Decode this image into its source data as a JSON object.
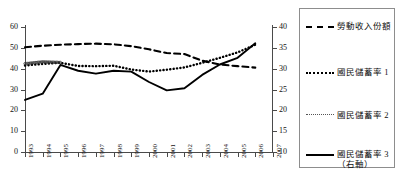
{
  "chart_data": {
    "type": "line",
    "title": "",
    "xlabel": "",
    "ylabel": "",
    "grid": false,
    "legend_position": "right",
    "x": [
      1993,
      1994,
      1995,
      1996,
      1997,
      1998,
      1999,
      2000,
      2001,
      2002,
      2003,
      2004,
      2005,
      2006
    ],
    "xtick_labels": [
      "1993",
      "1994",
      "1995",
      "1996",
      "1997",
      "1998",
      "1999",
      "2000",
      "2001",
      "2002",
      "2003",
      "2004",
      "2005",
      "2006",
      "2007"
    ],
    "xlim": [
      1993,
      2007
    ],
    "left_axis": {
      "ylim": [
        0,
        60
      ],
      "ytick_labels": [
        "0",
        "10",
        "20",
        "30",
        "40",
        "50",
        "60"
      ],
      "yticks": [
        0,
        10,
        20,
        30,
        40,
        50,
        60
      ]
    },
    "right_axis": {
      "ylim": [
        10,
        40
      ],
      "ytick_labels": [
        "10",
        "15",
        "20",
        "25",
        "30",
        "35",
        "40"
      ],
      "yticks": [
        10,
        15,
        20,
        25,
        30,
        35,
        40
      ]
    },
    "series": [
      {
        "name": "勞動收入份額",
        "style": "dashed",
        "axis": "left",
        "x": [
          1993,
          1994,
          1995,
          1996,
          1997,
          1998,
          1999,
          2000,
          2001,
          2002,
          2003,
          2004,
          2005,
          2006
        ],
        "values": [
          50.3,
          51.0,
          51.5,
          51.8,
          52.0,
          51.7,
          50.8,
          49.3,
          47.5,
          47.0,
          43.8,
          42.0,
          41.2,
          40.5
        ]
      },
      {
        "name": "國民儲蓄率 1",
        "style": "dotted",
        "axis": "left",
        "x": [
          1993,
          1994,
          1995,
          1996,
          1997,
          1998,
          1999,
          2000,
          2001,
          2002,
          2003,
          2004,
          2005,
          2006
        ],
        "values": [
          41.5,
          42.3,
          42.8,
          41.3,
          41.2,
          41.4,
          39.6,
          38.6,
          39.5,
          40.6,
          42.8,
          45.2,
          47.8,
          51.5
        ]
      },
      {
        "name": "國民儲蓄率 2",
        "style": "circles",
        "axis": "left",
        "x": [
          1993,
          1994,
          1995
        ],
        "values": [
          42.4,
          43.3,
          43.0
        ]
      },
      {
        "name": "國民儲蓄率 3",
        "style": "solid",
        "axis": "right",
        "axis_note": "（右軸）",
        "x": [
          1993,
          1994,
          1995,
          1996,
          1997,
          1998,
          1999,
          2000,
          2001,
          2002,
          2003,
          2004,
          2005,
          2006
        ],
        "values": [
          22.5,
          24.0,
          30.9,
          29.5,
          28.8,
          29.5,
          29.3,
          26.8,
          24.8,
          25.3,
          28.5,
          31.0,
          32.6,
          36.1
        ]
      }
    ]
  },
  "legend": {
    "entries": [
      {
        "label": "勞動收入份額",
        "sub": ""
      },
      {
        "label": "國民儲蓄率 1",
        "sub": ""
      },
      {
        "label": "國民儲蓄率 2",
        "sub": ""
      },
      {
        "label": "國民儲蓄率 3",
        "sub": "（右軸）"
      }
    ]
  }
}
